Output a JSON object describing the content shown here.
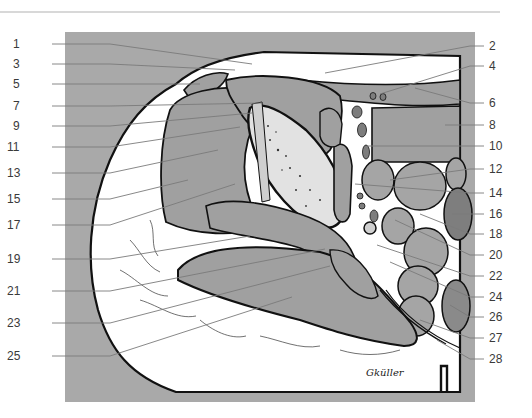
{
  "figure": {
    "type": "anatomical cross-section illustration",
    "signature": "Gküller",
    "colors": {
      "panel_background": "#a9a9a9",
      "skin_fat": "#ffffff",
      "muscle": "#a0a0a0",
      "muscle_dark": "#8a8a8a",
      "bone": "#e0e0e0",
      "outline": "#111111",
      "leader_line": "#7a7a7a",
      "label_text": "#3a3a3a"
    },
    "labels_left": [
      {
        "num": "1",
        "y": 44,
        "tx": 252,
        "ty": 64
      },
      {
        "num": "3",
        "y": 64,
        "tx": 235,
        "ty": 70
      },
      {
        "num": "5",
        "y": 84,
        "tx": 200,
        "ty": 84
      },
      {
        "num": "7",
        "y": 106,
        "tx": 262,
        "ty": 103
      },
      {
        "num": "9",
        "y": 126,
        "tx": 252,
        "ty": 113
      },
      {
        "num": "11",
        "y": 147,
        "tx": 240,
        "ty": 127
      },
      {
        "num": "13",
        "y": 173,
        "tx": 218,
        "ty": 150
      },
      {
        "num": "15",
        "y": 199,
        "tx": 188,
        "ty": 180
      },
      {
        "num": "17",
        "y": 225,
        "tx": 235,
        "ty": 184
      },
      {
        "num": "19",
        "y": 259,
        "tx": 250,
        "ty": 236
      },
      {
        "num": "21",
        "y": 291,
        "tx": 325,
        "ty": 249
      },
      {
        "num": "23",
        "y": 323,
        "tx": 330,
        "ty": 266
      },
      {
        "num": "25",
        "y": 356,
        "tx": 292,
        "ty": 297
      }
    ],
    "labels_right": [
      {
        "num": "2",
        "y": 46,
        "tx": 325,
        "ty": 73
      },
      {
        "num": "4",
        "y": 66,
        "tx": 380,
        "ty": 94
      },
      {
        "num": "6",
        "y": 103,
        "tx": 415,
        "ty": 88
      },
      {
        "num": "8",
        "y": 125,
        "tx": 445,
        "ty": 125
      },
      {
        "num": "10",
        "y": 146,
        "tx": 367,
        "ty": 146
      },
      {
        "num": "12",
        "y": 169,
        "tx": 390,
        "ty": 180
      },
      {
        "num": "14",
        "y": 193,
        "tx": 355,
        "ty": 184
      },
      {
        "num": "16",
        "y": 214,
        "tx": 452,
        "ty": 214
      },
      {
        "num": "18",
        "y": 234,
        "tx": 420,
        "ty": 214
      },
      {
        "num": "20",
        "y": 255,
        "tx": 395,
        "ty": 220
      },
      {
        "num": "22",
        "y": 276,
        "tx": 377,
        "ty": 245
      },
      {
        "num": "24",
        "y": 297,
        "tx": 390,
        "ty": 262
      },
      {
        "num": "26",
        "y": 317,
        "tx": 450,
        "ty": 305
      },
      {
        "num": "27",
        "y": 338,
        "tx": 420,
        "ty": 320
      },
      {
        "num": "28",
        "y": 359,
        "tx": 437,
        "ty": 340
      }
    ]
  }
}
